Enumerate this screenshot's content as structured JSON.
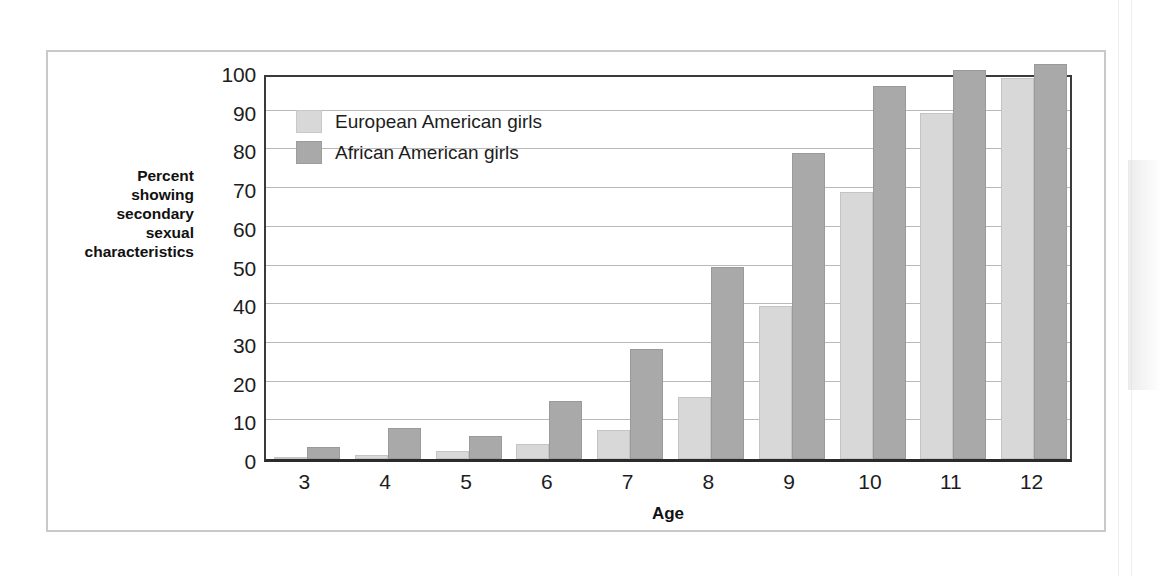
{
  "chart_data": {
    "type": "bar",
    "title": "",
    "xlabel": "Age",
    "ylabel": "Percent showing secondary sexual characteristics",
    "ylabel_lines": [
      "Percent",
      "showing",
      "secondary",
      "sexual",
      "characteristics"
    ],
    "categories": [
      "3",
      "4",
      "5",
      "6",
      "7",
      "8",
      "9",
      "10",
      "11",
      "12"
    ],
    "ylim": [
      0,
      100
    ],
    "ytick_labels": [
      "0",
      "10",
      "20",
      "30",
      "40",
      "50",
      "60",
      "70",
      "80",
      "90",
      "100"
    ],
    "ytick_values": [
      0,
      10,
      20,
      30,
      40,
      50,
      60,
      70,
      80,
      90,
      100
    ],
    "grid": true,
    "legend_position": "top-left inside plot",
    "series": [
      {
        "name": "European American girls",
        "color": "#d8d8d8",
        "values": [
          0.5,
          1,
          2,
          4,
          7.5,
          16,
          39.5,
          69,
          89.5,
          98.5
        ]
      },
      {
        "name": "African American girls",
        "color": "#a9a9a9",
        "values": [
          3,
          8,
          6,
          15,
          28.5,
          49.5,
          79,
          96.5,
          100.5,
          102
        ]
      }
    ]
  },
  "legend": {
    "items": [
      {
        "label": "European American girls",
        "swatch": "ea"
      },
      {
        "label": "African American girls",
        "swatch": "aa"
      }
    ]
  },
  "axes": {
    "x_title": "Age",
    "y_title_lines": [
      "Percent",
      "showing",
      "secondary",
      "sexual",
      "characteristics"
    ]
  }
}
